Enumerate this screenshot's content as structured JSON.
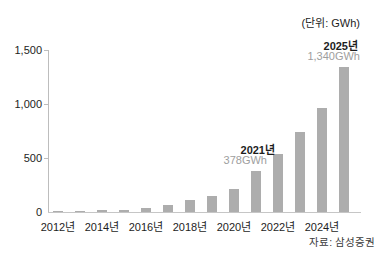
{
  "unit_note": "(단위: GWh)",
  "source_note": "자료: 삼성증권",
  "annotations": {
    "y2021": {
      "year_label": "2021년",
      "value_label": "378GWh"
    },
    "y2025": {
      "year_label": "2025년",
      "value_label": "1,340GWh"
    }
  },
  "colors": {
    "bar": "#adadad",
    "axis": "#c6c6c6",
    "text": "#1d1d1d",
    "annotation_value_text": "#9e9e9e",
    "background": "#ffffff"
  },
  "chart_data": {
    "type": "bar",
    "title": "",
    "unit": "GWh",
    "categories": [
      "2012년",
      "2013년",
      "2014년",
      "2015년",
      "2016년",
      "2017년",
      "2018년",
      "2019년",
      "2020년",
      "2021년",
      "2022년",
      "2023년",
      "2024년",
      "2025년"
    ],
    "values": [
      1,
      3,
      14,
      22,
      38,
      68,
      108,
      148,
      210,
      378,
      540,
      740,
      960,
      1340
    ],
    "labeled_points": [
      {
        "category": "2021년",
        "value": 378,
        "label": "378GWh"
      },
      {
        "category": "2025년",
        "value": 1340,
        "label": "1,340GWh"
      }
    ],
    "xlabel": "",
    "ylabel": "",
    "x_tick_labels": [
      "2012년",
      "2014년",
      "2016년",
      "2018년",
      "2020년",
      "2022년",
      "2024년"
    ],
    "y_ticks": [
      0,
      500,
      1000,
      1500
    ],
    "y_tick_labels": [
      "0",
      "500",
      "1,000",
      "1,500"
    ],
    "ylim": [
      0,
      1500
    ],
    "grid": false,
    "legend": false,
    "bar_color": "#adadad"
  }
}
